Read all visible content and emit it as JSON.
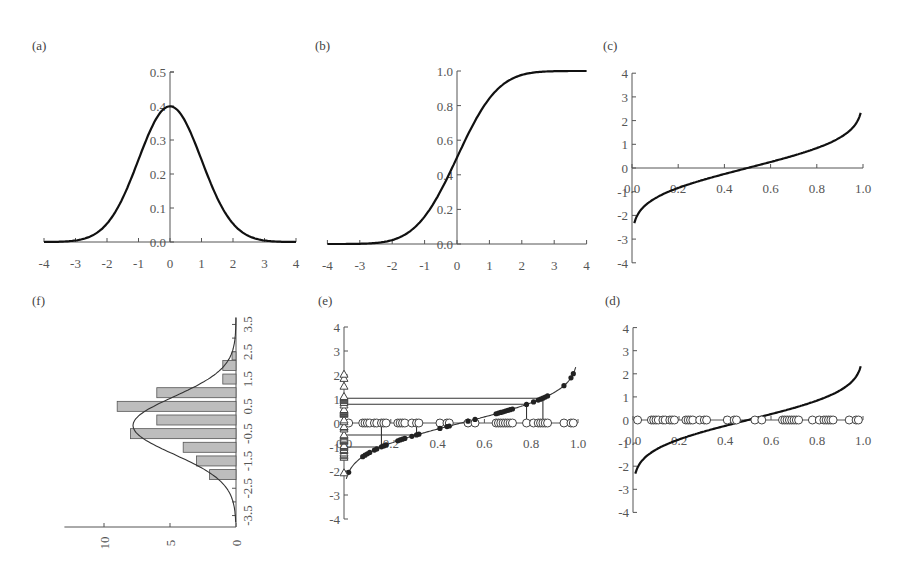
{
  "chart_data": [
    {
      "panel": "(a)",
      "type": "line",
      "title": "Standard normal probability density function",
      "x_ticks": [
        "-4",
        "-3",
        "-2",
        "-1",
        "0",
        "1",
        "2",
        "3",
        "4"
      ],
      "y_ticks": [
        "0.0",
        "0.1",
        "0.2",
        "0.3",
        "0.4",
        "0.5"
      ],
      "xlim": [
        -4,
        4
      ],
      "ylim": [
        0,
        0.5
      ],
      "series": [
        {
          "name": "pdf",
          "x": [
            -4,
            -3,
            -2,
            -1,
            0,
            1,
            2,
            3,
            4
          ],
          "y": [
            0.0001,
            0.0044,
            0.054,
            0.242,
            0.399,
            0.242,
            0.054,
            0.0044,
            0.0001
          ]
        }
      ]
    },
    {
      "panel": "(b)",
      "type": "line",
      "title": "Standard normal cumulative distribution function",
      "x_ticks": [
        "-4",
        "-3",
        "-2",
        "-1",
        "0",
        "1",
        "2",
        "3",
        "4"
      ],
      "y_ticks": [
        "0.0",
        "0.2",
        "0.4",
        "0.6",
        "0.8",
        "1.0"
      ],
      "xlim": [
        -4,
        4
      ],
      "ylim": [
        0,
        1.0
      ],
      "series": [
        {
          "name": "cdf",
          "x": [
            -4,
            -3,
            -2,
            -1,
            0,
            1,
            2,
            3,
            4
          ],
          "y": [
            0.0,
            0.001,
            0.023,
            0.159,
            0.5,
            0.841,
            0.977,
            0.999,
            1.0
          ]
        }
      ]
    },
    {
      "panel": "(c)",
      "type": "line",
      "title": "Inverse normal (quantile) function",
      "x_ticks": [
        "0.0",
        "0.2",
        "0.4",
        "0.6",
        "0.8",
        "1.0"
      ],
      "y_ticks": [
        "4",
        "3",
        "2",
        "1",
        "0",
        "-1",
        "-2",
        "-3",
        "-4"
      ],
      "xlim": [
        0,
        1.0
      ],
      "ylim": [
        -4,
        4
      ],
      "series": [
        {
          "name": "quantile",
          "x": [
            0.01,
            0.1,
            0.2,
            0.3,
            0.4,
            0.5,
            0.6,
            0.7,
            0.8,
            0.9,
            0.99
          ],
          "y": [
            -2.33,
            -1.28,
            -0.84,
            -0.52,
            -0.25,
            0,
            0.25,
            0.52,
            0.84,
            1.28,
            2.33
          ]
        }
      ]
    },
    {
      "panel": "(d)",
      "type": "scatter",
      "title": "Uniform random numbers on [0,1] with inverse normal curve",
      "x_ticks": [
        "0.0",
        "0.2",
        "0.4",
        "0.6",
        "0.8",
        "1.0"
      ],
      "y_ticks": [
        "4",
        "3",
        "2",
        "1",
        "0",
        "-1",
        "-2",
        "-3",
        "-4"
      ],
      "xlim": [
        0,
        1.0
      ],
      "ylim": [
        -4,
        4
      ],
      "series": [
        {
          "name": "uniform samples (open circles, y=0)",
          "x": [
            0.02,
            0.08,
            0.09,
            0.1,
            0.11,
            0.13,
            0.14,
            0.16,
            0.17,
            0.18,
            0.23,
            0.24,
            0.25,
            0.26,
            0.29,
            0.31,
            0.32,
            0.41,
            0.44,
            0.45,
            0.53,
            0.56,
            0.65,
            0.66,
            0.67,
            0.68,
            0.69,
            0.7,
            0.71,
            0.72,
            0.78,
            0.81,
            0.83,
            0.84,
            0.85,
            0.86,
            0.87,
            0.94,
            0.97,
            0.98
          ]
        },
        {
          "name": "quantile curve",
          "x": [
            0.01,
            0.1,
            0.2,
            0.3,
            0.4,
            0.5,
            0.6,
            0.7,
            0.8,
            0.9,
            0.99
          ],
          "y": [
            -2.33,
            -1.28,
            -0.84,
            -0.52,
            -0.25,
            0,
            0.25,
            0.52,
            0.84,
            1.28,
            2.33
          ]
        }
      ]
    },
    {
      "panel": "(e)",
      "type": "scatter",
      "title": "Mapping uniform samples through the inverse normal to normal deviates",
      "x_ticks": [
        "0.0",
        "0.2",
        "0.4",
        "0.6",
        "0.8",
        "1.0"
      ],
      "y_ticks": [
        "4",
        "3",
        "2",
        "1",
        "0",
        "-1",
        "-2",
        "-3",
        "-4"
      ],
      "xlim": [
        0,
        1.0
      ],
      "ylim": [
        -4,
        4
      ],
      "annotations": [
        "projection lines from x=0.16, 0.31, 0.78, 0.85 to curve and across to y-axis",
        "triangles on y-axis mark resulting normal deviates (about -2.1 to 2.0)"
      ],
      "series": [
        {
          "name": "uniform samples (open circles, y=0)",
          "x": [
            0.02,
            0.08,
            0.09,
            0.1,
            0.11,
            0.13,
            0.14,
            0.16,
            0.17,
            0.18,
            0.23,
            0.24,
            0.25,
            0.26,
            0.29,
            0.31,
            0.32,
            0.41,
            0.44,
            0.45,
            0.53,
            0.56,
            0.65,
            0.66,
            0.67,
            0.68,
            0.69,
            0.7,
            0.71,
            0.72,
            0.78,
            0.81,
            0.83,
            0.84,
            0.85,
            0.86,
            0.87,
            0.94,
            0.97,
            0.98
          ]
        },
        {
          "name": "mapped points on curve (filled dots)"
        },
        {
          "name": "normal deviates on y-axis (triangles)",
          "y_range": [
            -2.05,
            2.0
          ]
        },
        {
          "name": "projection lines",
          "segments": [
            {
              "x": 0.16,
              "y": -1.0
            },
            {
              "x": 0.31,
              "y": -0.5
            },
            {
              "x": 0.78,
              "y": 0.78
            },
            {
              "x": 0.85,
              "y": 1.03
            }
          ]
        }
      ]
    },
    {
      "panel": "(f)",
      "type": "bar",
      "orientation": "horizontal (rotated histogram)",
      "title": "Histogram of generated normal deviates with normal curve",
      "category_ticks": [
        "-3.5",
        "-2.5",
        "-1.5",
        "-0.5",
        "0.5",
        "1.5",
        "2.5",
        "3.5"
      ],
      "value_ticks": [
        "10",
        "5",
        "0"
      ],
      "categories": [
        "-2.0",
        "-1.5",
        "-1.0",
        "-0.5",
        "0.0",
        "0.5",
        "1.0",
        "1.5",
        "2.0"
      ],
      "values": [
        2,
        3,
        4,
        8,
        6,
        9,
        6,
        1,
        1
      ],
      "value_range": [
        0,
        13
      ],
      "overlay": "fitted normal density curve peaking at about 7.8 near -0.2"
    }
  ],
  "panels": {
    "a": {
      "label": "(a)"
    },
    "b": {
      "label": "(b)"
    },
    "c": {
      "label": "(c)"
    },
    "d": {
      "label": "(d)"
    },
    "e": {
      "label": "(e)"
    },
    "f": {
      "label": "(f)"
    }
  },
  "ticks": {
    "sym_x": [
      "-4",
      "-3",
      "-2",
      "-1",
      "0",
      "1",
      "2",
      "3",
      "4"
    ],
    "pdf_y": [
      "0.0",
      "0.1",
      "0.2",
      "0.3",
      "0.4",
      "0.5"
    ],
    "cdf_y": [
      "0.0",
      "0.2",
      "0.4",
      "0.6",
      "0.8",
      "1.0"
    ],
    "unit_x": [
      "0.0",
      "0.2",
      "0.4",
      "0.6",
      "0.8",
      "1.0"
    ],
    "quant_y": [
      "4",
      "3",
      "2",
      "1",
      "0",
      "-1",
      "-2",
      "-3",
      "-4"
    ],
    "hist_cat": [
      "-3.5",
      "-2.5",
      "-1.5",
      "-0.5",
      "0.5",
      "1.5",
      "2.5",
      "3.5"
    ],
    "hist_val": [
      "10",
      "5",
      "0"
    ]
  }
}
